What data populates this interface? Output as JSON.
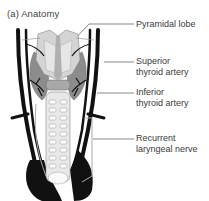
{
  "figure": {
    "title": "(a) Anatomy",
    "labels": [
      {
        "id": "pyramidal-lobe",
        "lines": [
          "Pyramidal lobe"
        ]
      },
      {
        "id": "superior-thyroid-artery",
        "lines": [
          "Superior",
          "thyroid artery"
        ]
      },
      {
        "id": "inferior-thyroid-artery",
        "lines": [
          "Inferior",
          "thyroid artery"
        ]
      },
      {
        "id": "recurrent-laryngeal-nerve",
        "lines": [
          "Recurrent",
          "laryngeal nerve"
        ]
      }
    ],
    "colors": {
      "vessel": "#111111",
      "thyroid": "#8c8c8c",
      "cartilage": "#d4d4d4",
      "leader": "#555555"
    }
  }
}
